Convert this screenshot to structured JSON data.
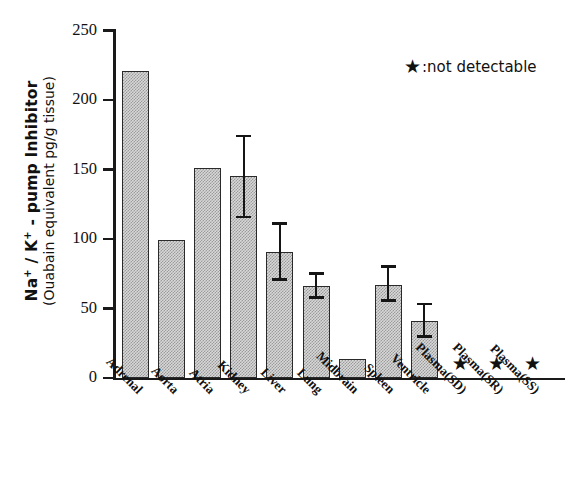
{
  "chart_data": {
    "type": "bar",
    "title": "",
    "xlabel": "",
    "ylabel_line1": "Na+ / K+ - pump Inhibitor",
    "ylabel_line2": "(Ouabain equivalent pg/g tissue)",
    "ylim": [
      0,
      250
    ],
    "yticks": [
      0,
      50,
      100,
      150,
      200,
      250
    ],
    "ytick_labels": [
      "0",
      "50",
      "100",
      "150",
      "200",
      "250"
    ],
    "grid": false,
    "legend_position": "top-right",
    "categories": [
      "Adrenal",
      "Aorta",
      "Atria",
      "Kidney",
      "Liver",
      "Lung",
      "Midbrain",
      "Spleen",
      "Ventricle",
      "Plasma(SD)",
      "Plasma(SR)",
      "Plasma(SS)"
    ],
    "values": [
      221,
      99,
      151,
      145,
      91,
      66,
      14,
      67,
      41,
      null,
      null,
      null
    ],
    "errors_upper": [
      null,
      null,
      null,
      175,
      112,
      76,
      null,
      81,
      54,
      null,
      null,
      null
    ],
    "errors_lower": [
      null,
      null,
      null,
      115,
      70,
      57,
      null,
      55,
      29,
      null,
      null,
      null
    ],
    "not_detectable": [
      "Plasma(SD)",
      "Plasma(SR)",
      "Plasma(SS)"
    ],
    "bars": [
      {
        "label": "Adrenal",
        "value": 221,
        "err_low": null,
        "err_high": null,
        "detectable": true
      },
      {
        "label": "Aorta",
        "value": 99,
        "err_low": null,
        "err_high": null,
        "detectable": true
      },
      {
        "label": "Atria",
        "value": 151,
        "err_low": null,
        "err_high": null,
        "detectable": true
      },
      {
        "label": "Kidney",
        "value": 145,
        "err_low": 115,
        "err_high": 175,
        "detectable": true
      },
      {
        "label": "Liver",
        "value": 91,
        "err_low": 70,
        "err_high": 112,
        "detectable": true
      },
      {
        "label": "Lung",
        "value": 66,
        "err_low": 57,
        "err_high": 76,
        "detectable": true
      },
      {
        "label": "Midbrain",
        "value": 14,
        "err_low": null,
        "err_high": null,
        "detectable": true
      },
      {
        "label": "Spleen",
        "value": 67,
        "err_low": 55,
        "err_high": 81,
        "detectable": true
      },
      {
        "label": "Ventricle",
        "value": 41,
        "err_low": 29,
        "err_high": 54,
        "detectable": true
      },
      {
        "label": "Plasma(SD)",
        "value": null,
        "err_low": null,
        "err_high": null,
        "detectable": false
      },
      {
        "label": "Plasma(SR)",
        "value": null,
        "err_low": null,
        "err_high": null,
        "detectable": false
      },
      {
        "label": "Plasma(SS)",
        "value": null,
        "err_low": null,
        "err_high": null,
        "detectable": false
      }
    ]
  },
  "legend": {
    "marker": "star-marker",
    "marker_glyph": "★",
    "separator": ":",
    "text": "not detectable",
    "full": "★ : not detectable"
  },
  "colors": {
    "axis": "#1a1a1a",
    "bar_fill": "#d8d8d8",
    "bar_pattern": "#9a9a9a",
    "bar_border": "#2a2a2a",
    "error_bar": "#151515",
    "text": "#111111",
    "background": "#ffffff"
  }
}
